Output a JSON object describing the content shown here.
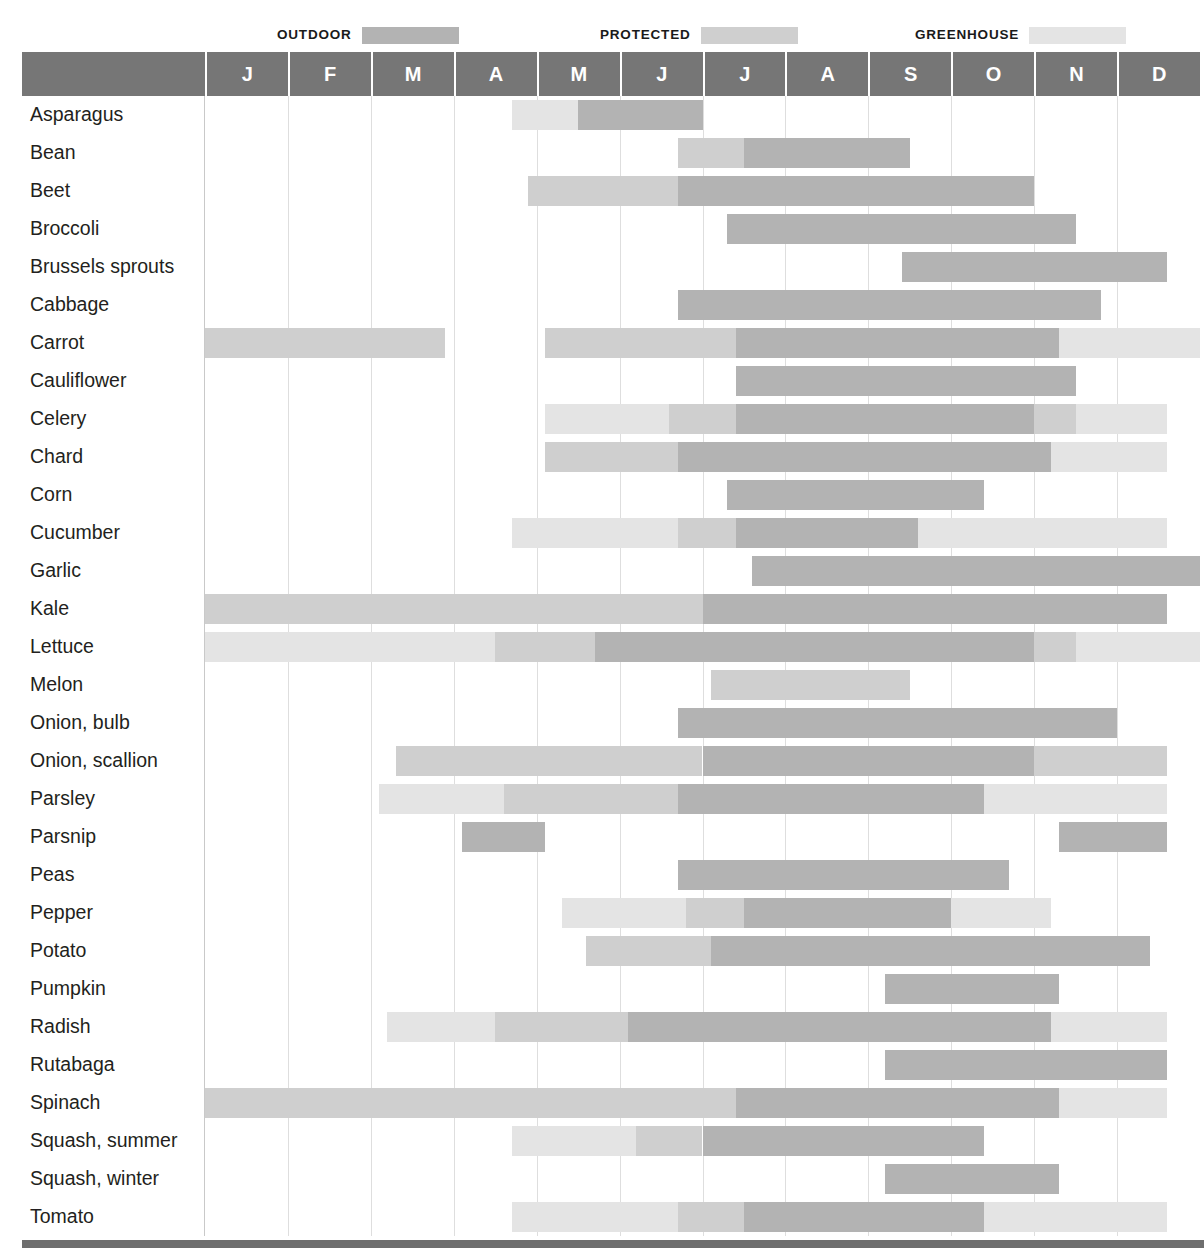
{
  "legend": {
    "items": [
      {
        "label": "OUTDOOR",
        "color": "#b3b3b3",
        "key": "outdoor"
      },
      {
        "label": "PROTECTED",
        "color": "#cfcfcf",
        "key": "protected"
      },
      {
        "label": "GREENHOUSE",
        "color": "#e4e4e4",
        "key": "greenhouse"
      }
    ]
  },
  "colors": {
    "outdoor": "#b3b3b3",
    "protected": "#cfcfcf",
    "greenhouse": "#e4e4e4",
    "header_band": "#767676",
    "header_text": "#ffffff",
    "gridline": "#dedede",
    "label_text": "#231f20",
    "bottom_rule": "#6e6e6e"
  },
  "chart_data": {
    "type": "bar",
    "title": "",
    "xlabel": "",
    "ylabel": "",
    "x": [
      "J",
      "F",
      "M",
      "A",
      "M",
      "J",
      "J",
      "A",
      "S",
      "O",
      "N",
      "D"
    ],
    "months_full": [
      "January",
      "February",
      "March",
      "April",
      "May",
      "June",
      "July",
      "August",
      "September",
      "October",
      "November",
      "December"
    ],
    "xlim": [
      0,
      12
    ],
    "grid": true,
    "legend_position": "top",
    "categories": [
      "Asparagus",
      "Bean",
      "Beet",
      "Broccoli",
      "Brussels sprouts",
      "Cabbage",
      "Carrot",
      "Cauliflower",
      "Celery",
      "Chard",
      "Corn",
      "Cucumber",
      "Garlic",
      "Kale",
      "Lettuce",
      "Melon",
      "Onion, bulb",
      "Onion, scallion",
      "Parsley",
      "Parsnip",
      "Peas",
      "Pepper",
      "Potato",
      "Pumpkin",
      "Radish",
      "Rutabaga",
      "Spinach",
      "Squash, summer",
      "Squash, winter",
      "Tomato"
    ],
    "series_keys": [
      "outdoor",
      "protected",
      "greenhouse"
    ],
    "rows": [
      {
        "name": "Asparagus",
        "segments": [
          {
            "type": "greenhouse",
            "start": 3.7,
            "end": 4.5
          },
          {
            "type": "outdoor",
            "start": 4.5,
            "end": 6.0
          }
        ]
      },
      {
        "name": "Bean",
        "segments": [
          {
            "type": "protected",
            "start": 5.7,
            "end": 6.5
          },
          {
            "type": "outdoor",
            "start": 6.5,
            "end": 8.5
          }
        ]
      },
      {
        "name": "Beet",
        "segments": [
          {
            "type": "protected",
            "start": 3.9,
            "end": 5.7
          },
          {
            "type": "outdoor",
            "start": 5.7,
            "end": 10.0
          }
        ]
      },
      {
        "name": "Broccoli",
        "segments": [
          {
            "type": "outdoor",
            "start": 6.3,
            "end": 10.5
          }
        ]
      },
      {
        "name": "Brussels sprouts",
        "segments": [
          {
            "type": "outdoor",
            "start": 8.4,
            "end": 11.6
          }
        ]
      },
      {
        "name": "Cabbage",
        "segments": [
          {
            "type": "outdoor",
            "start": 5.7,
            "end": 10.8
          }
        ]
      },
      {
        "name": "Carrot",
        "segments": [
          {
            "type": "protected",
            "start": 0.0,
            "end": 2.9
          },
          {
            "type": "protected",
            "start": 4.1,
            "end": 6.4
          },
          {
            "type": "outdoor",
            "start": 6.4,
            "end": 10.3
          },
          {
            "type": "greenhouse",
            "start": 10.3,
            "end": 12.0
          }
        ]
      },
      {
        "name": "Cauliflower",
        "segments": [
          {
            "type": "outdoor",
            "start": 6.4,
            "end": 10.5
          }
        ]
      },
      {
        "name": "Celery",
        "segments": [
          {
            "type": "greenhouse",
            "start": 4.1,
            "end": 5.6
          },
          {
            "type": "protected",
            "start": 5.6,
            "end": 6.4
          },
          {
            "type": "outdoor",
            "start": 6.4,
            "end": 10.0
          },
          {
            "type": "protected",
            "start": 10.0,
            "end": 10.5
          },
          {
            "type": "greenhouse",
            "start": 10.5,
            "end": 11.6
          }
        ]
      },
      {
        "name": "Chard",
        "segments": [
          {
            "type": "protected",
            "start": 4.1,
            "end": 5.7
          },
          {
            "type": "outdoor",
            "start": 5.7,
            "end": 10.2
          },
          {
            "type": "greenhouse",
            "start": 10.2,
            "end": 11.6
          }
        ]
      },
      {
        "name": "Corn",
        "segments": [
          {
            "type": "outdoor",
            "start": 6.3,
            "end": 9.4
          }
        ]
      },
      {
        "name": "Cucumber",
        "segments": [
          {
            "type": "greenhouse",
            "start": 3.7,
            "end": 5.7
          },
          {
            "type": "protected",
            "start": 5.7,
            "end": 6.4
          },
          {
            "type": "outdoor",
            "start": 6.4,
            "end": 8.6
          },
          {
            "type": "greenhouse",
            "start": 8.6,
            "end": 11.6
          }
        ]
      },
      {
        "name": "Garlic",
        "segments": [
          {
            "type": "outdoor",
            "start": 6.6,
            "end": 12.0
          }
        ]
      },
      {
        "name": "Kale",
        "segments": [
          {
            "type": "protected",
            "start": 0.0,
            "end": 6.0
          },
          {
            "type": "outdoor",
            "start": 6.0,
            "end": 11.6
          }
        ]
      },
      {
        "name": "Lettuce",
        "segments": [
          {
            "type": "greenhouse",
            "start": 0.0,
            "end": 3.5
          },
          {
            "type": "protected",
            "start": 3.5,
            "end": 4.7
          },
          {
            "type": "outdoor",
            "start": 4.7,
            "end": 10.0
          },
          {
            "type": "protected",
            "start": 10.0,
            "end": 10.5
          },
          {
            "type": "greenhouse",
            "start": 10.5,
            "end": 12.0
          }
        ]
      },
      {
        "name": "Melon",
        "segments": [
          {
            "type": "protected",
            "start": 6.1,
            "end": 8.5
          }
        ]
      },
      {
        "name": "Onion, bulb",
        "segments": [
          {
            "type": "outdoor",
            "start": 5.7,
            "end": 11.0
          }
        ]
      },
      {
        "name": "Onion, scallion",
        "segments": [
          {
            "type": "protected",
            "start": 2.3,
            "end": 6.0
          },
          {
            "type": "outdoor",
            "start": 6.0,
            "end": 10.0
          },
          {
            "type": "protected",
            "start": 10.0,
            "end": 11.6
          }
        ]
      },
      {
        "name": "Parsley",
        "segments": [
          {
            "type": "greenhouse",
            "start": 2.1,
            "end": 3.6
          },
          {
            "type": "protected",
            "start": 3.6,
            "end": 5.7
          },
          {
            "type": "outdoor",
            "start": 5.7,
            "end": 9.4
          },
          {
            "type": "greenhouse",
            "start": 9.4,
            "end": 11.6
          }
        ]
      },
      {
        "name": "Parsnip",
        "segments": [
          {
            "type": "outdoor",
            "start": 3.1,
            "end": 4.1
          },
          {
            "type": "outdoor",
            "start": 10.3,
            "end": 11.6
          }
        ]
      },
      {
        "name": "Peas",
        "segments": [
          {
            "type": "outdoor",
            "start": 5.7,
            "end": 9.7
          }
        ]
      },
      {
        "name": "Pepper",
        "segments": [
          {
            "type": "greenhouse",
            "start": 4.3,
            "end": 5.8
          },
          {
            "type": "protected",
            "start": 5.8,
            "end": 6.5
          },
          {
            "type": "outdoor",
            "start": 6.5,
            "end": 9.0
          },
          {
            "type": "greenhouse",
            "start": 9.0,
            "end": 10.2
          }
        ]
      },
      {
        "name": "Potato",
        "segments": [
          {
            "type": "protected",
            "start": 4.6,
            "end": 6.1
          },
          {
            "type": "outdoor",
            "start": 6.1,
            "end": 11.4
          }
        ]
      },
      {
        "name": "Pumpkin",
        "segments": [
          {
            "type": "outdoor",
            "start": 8.2,
            "end": 10.3
          }
        ]
      },
      {
        "name": "Radish",
        "segments": [
          {
            "type": "greenhouse",
            "start": 2.2,
            "end": 3.5
          },
          {
            "type": "protected",
            "start": 3.5,
            "end": 5.1
          },
          {
            "type": "outdoor",
            "start": 5.1,
            "end": 10.2
          },
          {
            "type": "greenhouse",
            "start": 10.2,
            "end": 11.6
          }
        ]
      },
      {
        "name": "Rutabaga",
        "segments": [
          {
            "type": "outdoor",
            "start": 8.2,
            "end": 11.6
          }
        ]
      },
      {
        "name": "Spinach",
        "segments": [
          {
            "type": "protected",
            "start": 0.0,
            "end": 6.4
          },
          {
            "type": "outdoor",
            "start": 6.4,
            "end": 10.3
          },
          {
            "type": "greenhouse",
            "start": 10.3,
            "end": 11.6
          }
        ]
      },
      {
        "name": "Squash, summer",
        "segments": [
          {
            "type": "greenhouse",
            "start": 3.7,
            "end": 5.2
          },
          {
            "type": "protected",
            "start": 5.2,
            "end": 6.0
          },
          {
            "type": "outdoor",
            "start": 6.0,
            "end": 9.4
          }
        ]
      },
      {
        "name": "Squash, winter",
        "segments": [
          {
            "type": "outdoor",
            "start": 8.2,
            "end": 10.3
          }
        ]
      },
      {
        "name": "Tomato",
        "segments": [
          {
            "type": "greenhouse",
            "start": 3.7,
            "end": 5.7
          },
          {
            "type": "protected",
            "start": 5.7,
            "end": 6.5
          },
          {
            "type": "outdoor",
            "start": 6.5,
            "end": 9.4
          },
          {
            "type": "greenhouse",
            "start": 9.4,
            "end": 11.6
          }
        ]
      }
    ]
  }
}
